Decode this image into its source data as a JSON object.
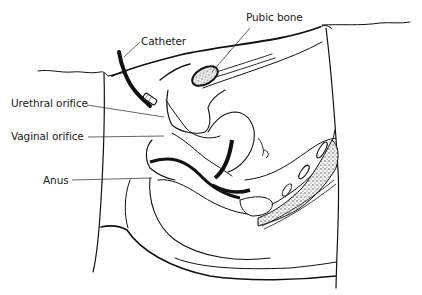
{
  "diagram": {
    "type": "anatomical-illustration",
    "labels": {
      "catheter": "Catheter",
      "pubic_bone": "Pubic bone",
      "urethral_orifice": "Urethral orifice",
      "vaginal_orifice": "Vaginal orifice",
      "anus": "Anus"
    },
    "colors": {
      "line": "#111111",
      "background": "#ffffff",
      "stipple": "#555555"
    }
  }
}
